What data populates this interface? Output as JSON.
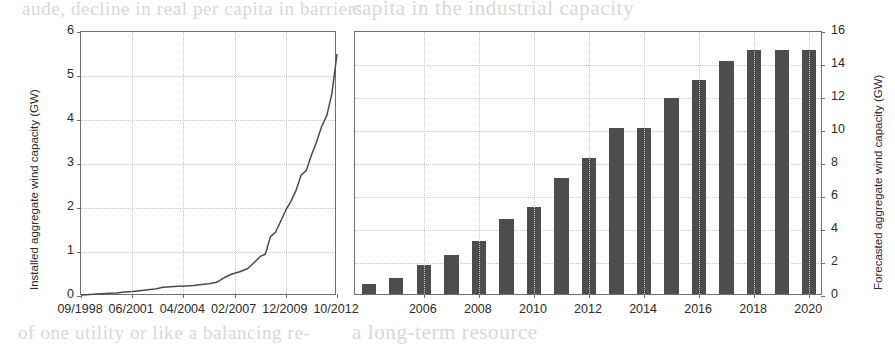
{
  "page": {
    "background_color": "#ffffff",
    "bleed_text": {
      "top_left": "aude, decline in real per capita in barriers",
      "top_right": "capita in the industrial capacity",
      "bottom_left": "of one utility or like a balancing re-",
      "bottom_right": "a long-term resource"
    }
  },
  "chart_data": [
    {
      "id": "installed-capacity-line",
      "type": "line",
      "title": "",
      "xlabel": "",
      "ylabel": "Installed aggregate wind capacity (GW)",
      "ylim": [
        0,
        6
      ],
      "yticks": [
        0,
        1,
        2,
        3,
        4,
        5,
        6
      ],
      "xtick_labels": [
        "09/1998",
        "06/2001",
        "04/2004",
        "02/2007",
        "12/2009",
        "10/2012"
      ],
      "grid": true,
      "legend": "none",
      "line_color": "#4a4a4a",
      "x": [
        0.0,
        0.02,
        0.05,
        0.08,
        0.11,
        0.14,
        0.17,
        0.2,
        0.23,
        0.26,
        0.29,
        0.32,
        0.35,
        0.38,
        0.41,
        0.44,
        0.47,
        0.5,
        0.53,
        0.56,
        0.59,
        0.62,
        0.65,
        0.68,
        0.7,
        0.72,
        0.74,
        0.76,
        0.78,
        0.8,
        0.82,
        0.84,
        0.86,
        0.88,
        0.9,
        0.92,
        0.94,
        0.96,
        0.98,
        1.0
      ],
      "values": [
        0.02,
        0.03,
        0.04,
        0.05,
        0.06,
        0.07,
        0.09,
        0.1,
        0.12,
        0.14,
        0.16,
        0.2,
        0.21,
        0.22,
        0.23,
        0.24,
        0.26,
        0.28,
        0.31,
        0.42,
        0.5,
        0.55,
        0.62,
        0.78,
        0.9,
        0.95,
        1.35,
        1.45,
        1.7,
        1.95,
        2.15,
        2.4,
        2.75,
        2.85,
        3.2,
        3.5,
        3.85,
        4.1,
        4.6,
        5.5
      ]
    },
    {
      "id": "forecasted-capacity-bar",
      "type": "bar",
      "title": "",
      "xlabel": "",
      "ylabel": "Forecasted aggregate wind capacity (GW)",
      "ylim": [
        0,
        16
      ],
      "yticks": [
        0,
        2,
        4,
        6,
        8,
        10,
        12,
        14,
        16
      ],
      "grid": true,
      "legend": "none",
      "bar_color": "#4d4d4d",
      "categories": [
        "2004",
        "2005",
        "2006",
        "2007",
        "2008",
        "2009",
        "2010",
        "2011",
        "2012",
        "2013",
        "2014",
        "2015",
        "2016",
        "2017",
        "2018",
        "2019",
        "2020"
      ],
      "xtick_labels": [
        "2006",
        "2008",
        "2010",
        "2012",
        "2014",
        "2016",
        "2018",
        "2020"
      ],
      "values": [
        0.6,
        1.0,
        1.75,
        2.35,
        3.2,
        4.55,
        5.3,
        7.05,
        8.25,
        10.05,
        10.05,
        11.85,
        13.0,
        14.1,
        14.8,
        14.8,
        14.8
      ]
    }
  ]
}
